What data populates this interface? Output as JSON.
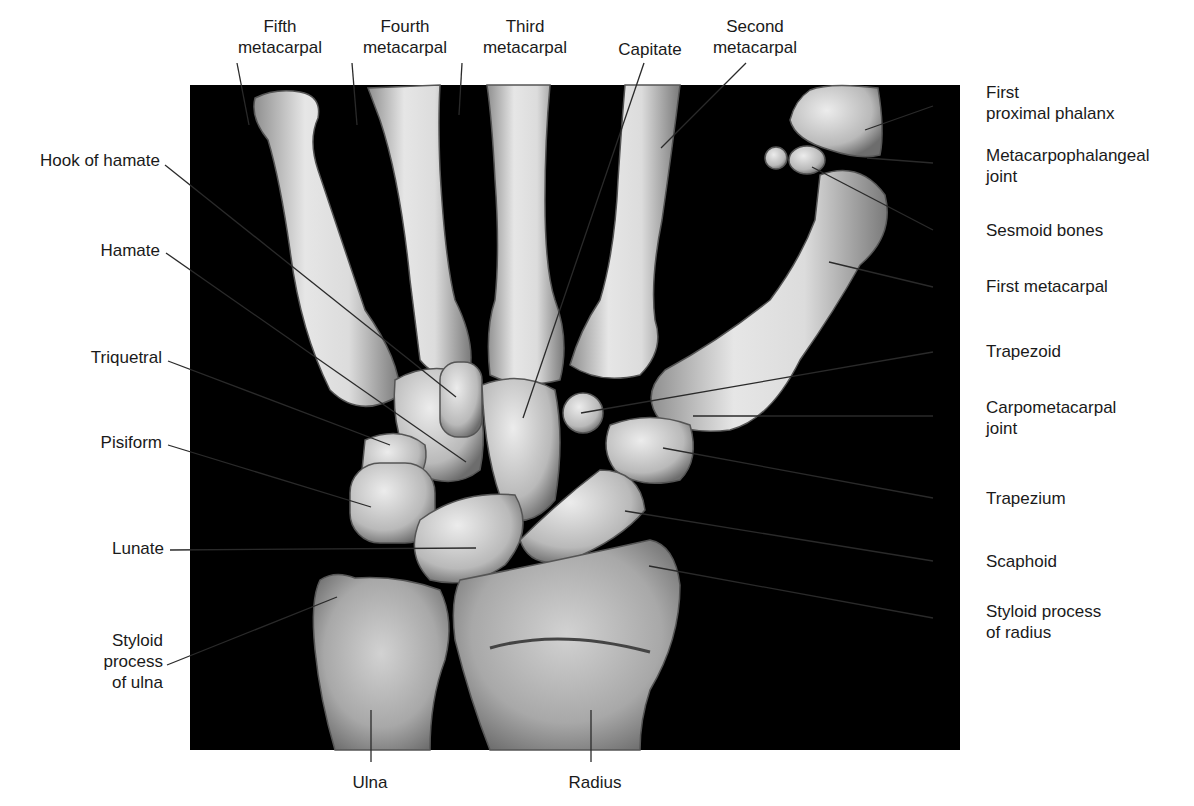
{
  "figure": {
    "panel": {
      "x": 190,
      "y": 85,
      "w": 770,
      "h": 665,
      "bg": "#000000"
    },
    "bone_color": "#d9d9d9",
    "bone_shadow": "#8a8a8a",
    "line_color": "#2a2a2a"
  },
  "labels": [
    {
      "id": "fifth-metacarpal",
      "lines": [
        "Fifth",
        "metacarpal"
      ],
      "align": "c",
      "x": 230,
      "y": 16,
      "w": 100,
      "line": [
        [
          237,
          63
        ],
        [
          249,
          125
        ]
      ]
    },
    {
      "id": "fourth-metacarpal",
      "lines": [
        "Fourth",
        "metacarpal"
      ],
      "align": "c",
      "x": 350,
      "y": 16,
      "w": 110,
      "line": [
        [
          352,
          63
        ],
        [
          357,
          125
        ]
      ]
    },
    {
      "id": "third-metacarpal",
      "lines": [
        "Third",
        "metacarpal"
      ],
      "align": "c",
      "x": 470,
      "y": 16,
      "w": 110,
      "line": [
        [
          462,
          63
        ],
        [
          459,
          115
        ]
      ]
    },
    {
      "id": "capitate",
      "lines": [
        "Capitate"
      ],
      "align": "c",
      "x": 605,
      "y": 39,
      "w": 90,
      "line": [
        [
          644,
          63
        ],
        [
          523,
          418
        ]
      ]
    },
    {
      "id": "second-metacarpal",
      "lines": [
        "Second",
        "metacarpal"
      ],
      "align": "c",
      "x": 700,
      "y": 16,
      "w": 110,
      "line": [
        [
          746,
          63
        ],
        [
          661,
          148
        ]
      ]
    },
    {
      "id": "first-proximal-phalanx",
      "lines": [
        "First",
        "proximal phalanx"
      ],
      "align": "l",
      "x": 986,
      "y": 82,
      "w": 190,
      "line": [
        [
          933,
          106
        ],
        [
          865,
          130
        ]
      ]
    },
    {
      "id": "metacarpophalangeal-joint",
      "lines": [
        "Metacarpophalangeal",
        "joint"
      ],
      "align": "l",
      "x": 986,
      "y": 145,
      "w": 200,
      "line": [
        [
          933,
          163
        ],
        [
          867,
          158
        ]
      ]
    },
    {
      "id": "sesmoid-bones",
      "lines": [
        "Sesmoid bones"
      ],
      "align": "l",
      "x": 986,
      "y": 220,
      "w": 160,
      "line": [
        [
          933,
          230
        ],
        [
          812,
          167
        ]
      ]
    },
    {
      "id": "first-metacarpal",
      "lines": [
        "First metacarpal"
      ],
      "align": "l",
      "x": 986,
      "y": 276,
      "w": 170,
      "line": [
        [
          933,
          287
        ],
        [
          829,
          262
        ]
      ]
    },
    {
      "id": "trapezoid",
      "lines": [
        "Trapezoid"
      ],
      "align": "l",
      "x": 986,
      "y": 341,
      "w": 120,
      "line": [
        [
          933,
          352
        ],
        [
          581,
          413
        ]
      ]
    },
    {
      "id": "carpometacarpal-joint",
      "lines": [
        "Carpometacarpal",
        "joint"
      ],
      "align": "l",
      "x": 986,
      "y": 397,
      "w": 170,
      "line": [
        [
          933,
          416
        ],
        [
          693,
          416
        ]
      ]
    },
    {
      "id": "trapezium",
      "lines": [
        "Trapezium"
      ],
      "align": "l",
      "x": 986,
      "y": 488,
      "w": 120,
      "line": [
        [
          933,
          498
        ],
        [
          663,
          448
        ]
      ]
    },
    {
      "id": "scaphoid",
      "lines": [
        "Scaphoid"
      ],
      "align": "l",
      "x": 986,
      "y": 551,
      "w": 110,
      "line": [
        [
          933,
          561
        ],
        [
          625,
          511
        ]
      ]
    },
    {
      "id": "styloid-process-of-radius",
      "lines": [
        "Styloid process",
        "of radius"
      ],
      "align": "l",
      "x": 986,
      "y": 601,
      "w": 170,
      "line": [
        [
          933,
          618
        ],
        [
          649,
          566
        ]
      ]
    },
    {
      "id": "hook-of-hamate",
      "lines": [
        "Hook of hamate"
      ],
      "align": "r",
      "x": 10,
      "y": 150,
      "w": 150,
      "line": [
        [
          165,
          165
        ],
        [
          456,
          397
        ]
      ]
    },
    {
      "id": "hamate",
      "lines": [
        "Hamate"
      ],
      "align": "r",
      "x": 60,
      "y": 240,
      "w": 100,
      "line": [
        [
          166,
          253
        ],
        [
          466,
          462
        ]
      ]
    },
    {
      "id": "triquetral",
      "lines": [
        "Triquetral"
      ],
      "align": "r",
      "x": 60,
      "y": 347,
      "w": 102,
      "line": [
        [
          168,
          361
        ],
        [
          390,
          445
        ]
      ]
    },
    {
      "id": "pisiform",
      "lines": [
        "Pisiform"
      ],
      "align": "r",
      "x": 60,
      "y": 432,
      "w": 102,
      "line": [
        [
          168,
          445
        ],
        [
          371,
          507
        ]
      ]
    },
    {
      "id": "lunate",
      "lines": [
        "Lunate"
      ],
      "align": "r",
      "x": 60,
      "y": 538,
      "w": 104,
      "line": [
        [
          170,
          550
        ],
        [
          476,
          548
        ]
      ]
    },
    {
      "id": "styloid-process-of-ulna",
      "lines": [
        "Styloid",
        "process",
        "of ulna"
      ],
      "align": "r",
      "x": 60,
      "y": 630,
      "w": 103,
      "line": [
        [
          167,
          665
        ],
        [
          337,
          597
        ]
      ]
    },
    {
      "id": "ulna",
      "lines": [
        "Ulna"
      ],
      "align": "c",
      "x": 340,
      "y": 772,
      "w": 60,
      "line": [
        [
          371,
          762
        ],
        [
          371,
          710
        ]
      ]
    },
    {
      "id": "radius",
      "lines": [
        "Radius"
      ],
      "align": "c",
      "x": 560,
      "y": 772,
      "w": 70,
      "line": [
        [
          591,
          762
        ],
        [
          591,
          710
        ]
      ]
    }
  ]
}
